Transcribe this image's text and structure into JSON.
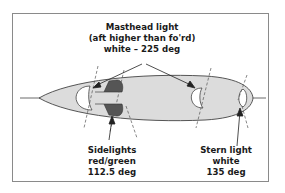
{
  "diagram": {
    "labels": {
      "masthead": {
        "line1": "Masthead light",
        "line2": "(aft higher than fo'rd)",
        "line3": "white – 225 deg"
      },
      "sidelights": {
        "line1": "Sidelights",
        "line2": "red/green",
        "line3": "112.5 deg"
      },
      "stern": {
        "line1": "Stern light",
        "line2": "white",
        "line3": "135 deg"
      }
    },
    "colors": {
      "hull_fill": "#dcdcdc",
      "sidelight_fill": "#555555",
      "outline": "#333333",
      "frame": "#8a8a8a"
    }
  }
}
